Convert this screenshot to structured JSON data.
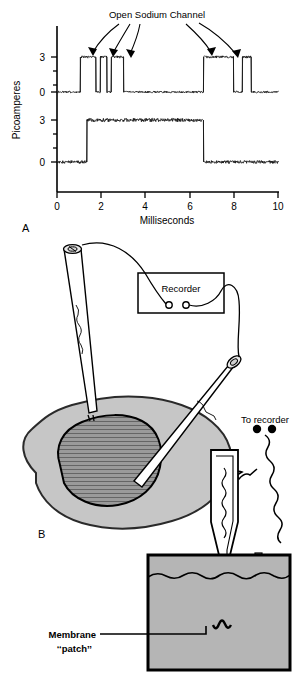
{
  "figure": {
    "panel_a_letter": "A",
    "panel_b_letter": "B"
  },
  "chart_data": {
    "type": "line",
    "title": "Open Sodium Channel",
    "xlabel": "Milliseconds",
    "ylabel": "Picoamperes",
    "xlim": [
      0,
      10
    ],
    "xticks": [
      0,
      2,
      4,
      6,
      8,
      10
    ],
    "xticklabels": [
      "0",
      "2",
      "4",
      "6",
      "8",
      "10"
    ],
    "grid": false,
    "legend": "none",
    "annotation": "Open Sodium Channel",
    "annotation_arrow_count": 5,
    "series": [
      {
        "name": "single-channel-record",
        "yticks": [
          0,
          3
        ],
        "yticklabels": [
          "0",
          "3"
        ],
        "ylim": [
          -0.6,
          4.0
        ],
        "open_level_pa": 3,
        "closed_level_pa": 0,
        "openings_ms": [
          [
            1.05,
            1.75
          ],
          [
            1.95,
            2.25
          ],
          [
            2.45,
            3.0
          ],
          [
            6.6,
            7.95
          ],
          [
            8.35,
            8.75
          ]
        ]
      },
      {
        "name": "ensemble-average-record",
        "yticks": [
          0,
          3
        ],
        "yticklabels": [
          "0",
          "3"
        ],
        "ylim": [
          -0.6,
          4.0
        ],
        "open_level_pa": 3,
        "closed_level_pa": 0,
        "openings_ms": [
          [
            1.35,
            6.6
          ]
        ]
      }
    ]
  },
  "diagram": {
    "recorder_label": "Recorder",
    "to_recorder_label": "To recorder",
    "membrane_label": "Membrane",
    "patch_label": "‘‘patch’’",
    "colors": {
      "cytoplasm": "#c6c6c6",
      "nucleus": "#9a9a9a",
      "bath_solution": "#b5b5b5",
      "outline": "#000000"
    }
  }
}
